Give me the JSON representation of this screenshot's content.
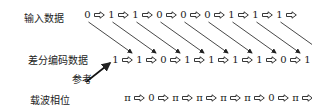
{
  "labels": {
    "input_data": "输入数据",
    "diff_encoded_data": "差分编码数据",
    "reference": "参考",
    "carrier_phase": "载波相位"
  },
  "rows": {
    "input": [
      "0",
      "1",
      "1",
      "0",
      "0",
      "0",
      "1",
      "1",
      "1"
    ],
    "encoded": [
      "1",
      "1",
      "0",
      "1",
      "1",
      "1",
      "1",
      "0",
      "1",
      "0"
    ],
    "phase": [
      "π",
      "0",
      "π",
      "π",
      "π",
      "π",
      "0",
      "π",
      "0"
    ]
  },
  "notes": {
    "phase_row_inconsistency": "The printed carrier-phase row (9 values: π 0 π π π π 0 π 0) does not follow from the encoded row (10 values) under the usual mapping 1→π, 0→0, which would give π π 0 π π π π 0 π 0. Transcribed as printed; likely an error or misalignment in the source figure."
  },
  "icons": {
    "row_arrow": "hollow-right-arrow-icon",
    "diagonal_arrow": "diagonal-arrow-icon",
    "reference_arrow": "reference-arrow-icon"
  }
}
